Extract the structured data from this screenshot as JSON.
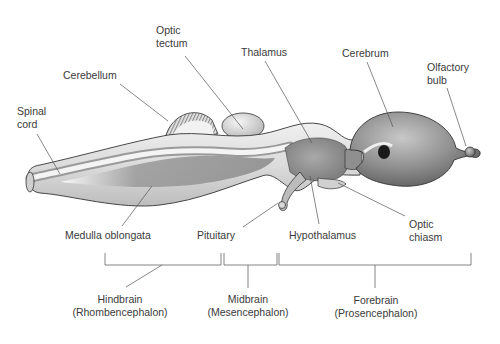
{
  "labels": {
    "optic_tectum": {
      "line1": "Optic",
      "line2": "tectum"
    },
    "thalamus": "Thalamus",
    "cerebrum": "Cerebrum",
    "olfactory_bulb": {
      "line1": "Olfactory",
      "line2": "bulb"
    },
    "cerebellum": "Cerebellum",
    "spinal_cord": {
      "line1": "Spinal",
      "line2": "cord"
    },
    "medulla_oblongata": "Medulla oblongata",
    "pituitary": "Pituitary",
    "hypothalamus": "Hypothalamus",
    "optic_chiasm": {
      "line1": "Optic",
      "line2": "chiasm"
    }
  },
  "divisions": [
    {
      "name": "Hindbrain",
      "latin": "(Rhombencephalon)"
    },
    {
      "name": "Midbrain",
      "latin": "(Mesencephalon)"
    },
    {
      "name": "Forebrain",
      "latin": "(Prosencephalon)"
    }
  ],
  "colors": {
    "tissue_dark": "#7a7a7a",
    "tissue_mid": "#a8a8a8",
    "tissue_light": "#e6e6e6",
    "outline": "#333333",
    "leader": "#555555",
    "text": "#3a3a3a"
  }
}
